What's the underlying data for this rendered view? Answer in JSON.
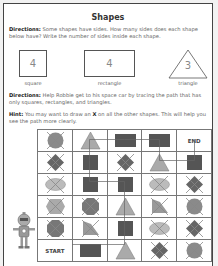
{
  "title": "Shapes",
  "directions1": {
    "label": "Directions:",
    "text": " Some shapes have sides. How many sides does each shape below have? Write the number of sides inside each shape."
  },
  "shapes": [
    {
      "name": "square",
      "sides": "4"
    },
    {
      "name": "rectangle",
      "sides": "4"
    },
    {
      "name": "triangle",
      "sides": "3"
    }
  ],
  "directions2": {
    "label": "Directions:",
    "text": " Help Robbie get to his space car by tracing the path that has only squares, rectangles, and triangles."
  },
  "hint": {
    "label": "Hint:",
    "text_before": " You may want to draw an ",
    "x": "X",
    "text_after": " on all the other shapes. This will help you see the path more clearly."
  },
  "maze": {
    "start_label": "START",
    "end_label": "END",
    "rows": [
      [
        "circle-x",
        "triangle",
        "rectangle",
        "rectangle",
        "end"
      ],
      [
        "diamond-x",
        "square",
        "diamond-x",
        "triangle",
        "square"
      ],
      [
        "oval-x",
        "square",
        "square",
        "oval-x",
        "diamond-x"
      ],
      [
        "hexagon-x",
        "octagon-x",
        "triangle",
        "trapezoid-x",
        "circle-x"
      ],
      [
        "octagon-x",
        "trapezoid-x",
        "square",
        "oval-x",
        "diamond-x"
      ],
      [
        "start",
        "rectangle",
        "triangle",
        "diamond-x",
        "circle-x"
      ]
    ]
  },
  "colors": {
    "square": "#555555",
    "triangle": "#aaaaaa",
    "other": "#8a8a8a",
    "line": "#666666"
  }
}
